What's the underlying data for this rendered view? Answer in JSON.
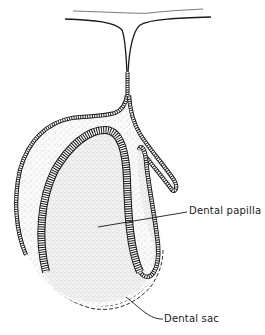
{
  "figure": {
    "type": "anatomical-line-drawing",
    "colors": {
      "ink": "#1a1a1a",
      "stipple": "#9a9a9a",
      "background": "#ffffff"
    }
  },
  "labels": [
    {
      "id": "dental-papilla",
      "text": "Dental papilla"
    },
    {
      "id": "dental-sac",
      "text": "Dental sac"
    }
  ]
}
